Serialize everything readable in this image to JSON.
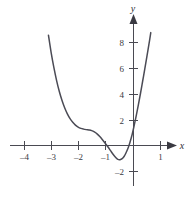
{
  "chart_data": {
    "type": "line",
    "title": "",
    "subtitle": "",
    "xlabel": "x",
    "ylabel": "y",
    "xlim": [
      -4.6,
      1.8
    ],
    "ylim": [
      -2.8,
      9.2
    ],
    "grid": false,
    "legend": null,
    "x_ticks": [
      {
        "value": -4,
        "label": "–4"
      },
      {
        "value": -3,
        "label": "–3"
      },
      {
        "value": -2,
        "label": "–2"
      },
      {
        "value": -1,
        "label": "–1"
      },
      {
        "value": 1,
        "label": "1"
      }
    ],
    "y_ticks": [
      {
        "value": 8,
        "label": "8"
      },
      {
        "value": 6,
        "label": "6"
      },
      {
        "value": 4,
        "label": "4"
      },
      {
        "value": 2,
        "label": "2"
      },
      {
        "value": -2,
        "label": "–2"
      }
    ],
    "series": [
      {
        "name": "curve",
        "color": "#4b4b55",
        "points": [
          {
            "x": -3.15,
            "y": 8.55
          },
          {
            "x": -3.05,
            "y": 7.2
          },
          {
            "x": -2.95,
            "y": 6.05
          },
          {
            "x": -2.85,
            "y": 5.05
          },
          {
            "x": -2.75,
            "y": 4.2
          },
          {
            "x": -2.65,
            "y": 3.5
          },
          {
            "x": -2.55,
            "y": 2.92
          },
          {
            "x": -2.45,
            "y": 2.45
          },
          {
            "x": -2.35,
            "y": 2.08
          },
          {
            "x": -2.25,
            "y": 1.8
          },
          {
            "x": -2.15,
            "y": 1.58
          },
          {
            "x": -2.05,
            "y": 1.43
          },
          {
            "x": -1.95,
            "y": 1.33
          },
          {
            "x": -1.85,
            "y": 1.27
          },
          {
            "x": -1.75,
            "y": 1.23
          },
          {
            "x": -1.65,
            "y": 1.2
          },
          {
            "x": -1.55,
            "y": 1.15
          },
          {
            "x": -1.45,
            "y": 1.05
          },
          {
            "x": -1.35,
            "y": 0.9
          },
          {
            "x": -1.25,
            "y": 0.7
          },
          {
            "x": -1.15,
            "y": 0.45
          },
          {
            "x": -1.05,
            "y": 0.18
          },
          {
            "x": -0.95,
            "y": -0.1
          },
          {
            "x": -0.85,
            "y": -0.4
          },
          {
            "x": -0.75,
            "y": -0.7
          },
          {
            "x": -0.65,
            "y": -0.95
          },
          {
            "x": -0.58,
            "y": -1.08
          },
          {
            "x": -0.5,
            "y": -1.1
          },
          {
            "x": -0.42,
            "y": -1.02
          },
          {
            "x": -0.35,
            "y": -0.85
          },
          {
            "x": -0.28,
            "y": -0.58
          },
          {
            "x": -0.2,
            "y": -0.2
          },
          {
            "x": -0.13,
            "y": 0.25
          },
          {
            "x": -0.05,
            "y": 0.85
          },
          {
            "x": 0.02,
            "y": 1.5
          },
          {
            "x": 0.1,
            "y": 2.3
          },
          {
            "x": 0.18,
            "y": 3.15
          },
          {
            "x": 0.26,
            "y": 4.05
          },
          {
            "x": 0.34,
            "y": 5.0
          },
          {
            "x": 0.42,
            "y": 5.95
          },
          {
            "x": 0.5,
            "y": 6.95
          },
          {
            "x": 0.58,
            "y": 7.95
          },
          {
            "x": 0.64,
            "y": 8.75
          }
        ]
      }
    ]
  },
  "axes": {
    "x_axis_name": "x",
    "y_axis_name": "y"
  }
}
